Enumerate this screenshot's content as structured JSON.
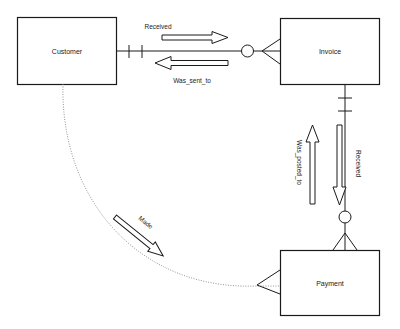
{
  "diagram": {
    "type": "entity-relationship",
    "colors": {
      "stroke": "#1a1a1a",
      "text": "#222222",
      "background": "#ffffff",
      "dotted": "#777777"
    },
    "entities": [
      {
        "id": "customer",
        "label": "Customer"
      },
      {
        "id": "invoice",
        "label": "Invoice"
      },
      {
        "id": "payment",
        "label": "Payment"
      }
    ],
    "relationships": [
      {
        "from": "customer",
        "to": "invoice",
        "label": "Received",
        "direction": "right",
        "from_cardinality": "exactly-one",
        "to_cardinality": "zero-or-many"
      },
      {
        "from": "invoice",
        "to": "customer",
        "label": "Was_sent_to",
        "direction": "left"
      },
      {
        "from": "invoice",
        "to": "payment",
        "label": "Received",
        "direction": "down",
        "from_cardinality": "exactly-one",
        "to_cardinality": "zero-or-many"
      },
      {
        "from": "payment",
        "to": "invoice",
        "label": "Was_posted_to",
        "direction": "up"
      },
      {
        "from": "customer",
        "to": "payment",
        "label": "Made",
        "direction": "down-right",
        "line_style": "dotted",
        "to_cardinality": "many"
      }
    ]
  }
}
